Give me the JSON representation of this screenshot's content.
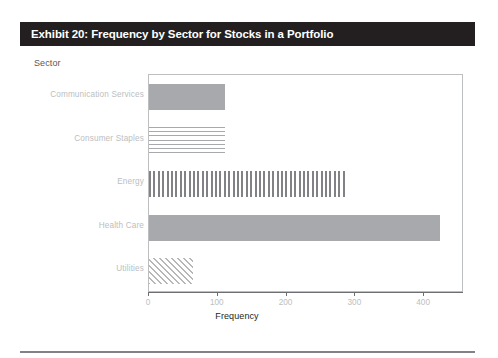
{
  "exhibit": {
    "title": "Exhibit 20: Frequency by Sector for Stocks in a Portfolio",
    "title_bg": "#231f20",
    "title_color": "#ffffff"
  },
  "axis_group_caption": "Sector",
  "chart_data": {
    "type": "bar",
    "orientation": "horizontal",
    "title": "Exhibit 20: Frequency by Sector for Stocks in a Portfolio",
    "xlabel": "Frequency",
    "ylabel": "Sector",
    "categories": [
      "Communication Services",
      "Consumer Staples",
      "Energy",
      "Health Care",
      "Utilities"
    ],
    "values": [
      111,
      110,
      287,
      423,
      64
    ],
    "xlim": [
      0,
      455
    ],
    "xticks": [
      0,
      100,
      200,
      300,
      400
    ],
    "xtick_labels": [
      "0",
      "100",
      "200",
      "300",
      "400"
    ],
    "grid": false,
    "legend": false,
    "bar_fills": [
      "solid",
      "horizontal-lines",
      "vertical-lines",
      "solid",
      "diagonal-hatch"
    ],
    "bar_color": "#a7a9ac",
    "series": [
      {
        "name": "Frequency",
        "values": [
          111,
          110,
          287,
          423,
          64
        ]
      }
    ]
  },
  "footer_rule_color": "#808285"
}
